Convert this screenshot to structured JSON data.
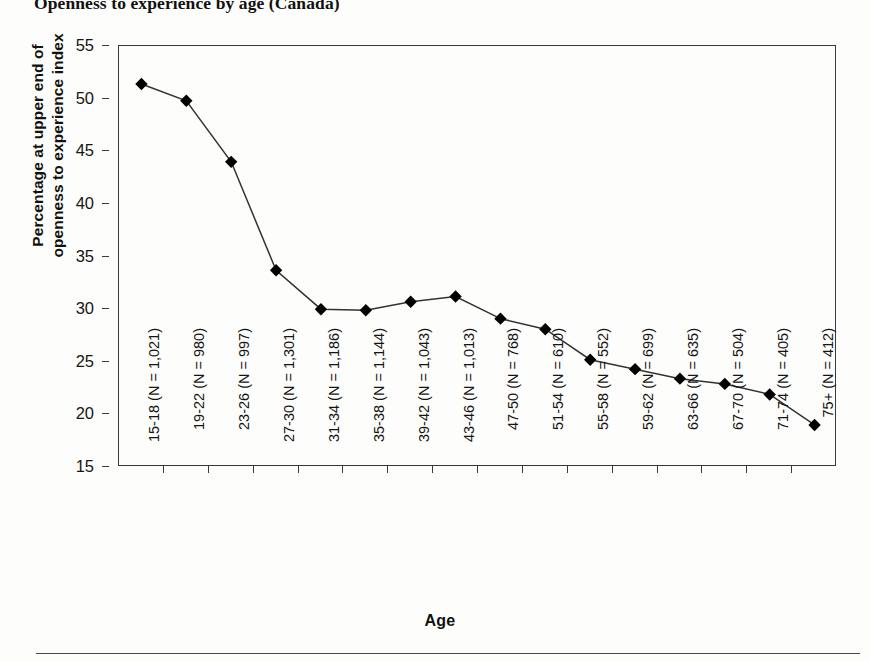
{
  "chart_data": {
    "type": "line",
    "title": "Openness to experience by age (Canada)",
    "xlabel": "Age",
    "ylabel": "Percentage at upper end of openness to experience index",
    "ylabel_lines": [
      "Percentage at upper end of",
      "openness to experience index"
    ],
    "ylim": [
      15,
      55
    ],
    "yticks": [
      15,
      20,
      25,
      30,
      35,
      40,
      45,
      50,
      55
    ],
    "ytick_labels": [
      "15",
      "20",
      "25",
      "30",
      "35",
      "40",
      "45",
      "50",
      "55"
    ],
    "grid": false,
    "legend": false,
    "marker": "diamond",
    "marker_color": "#000000",
    "line_color": "#333333",
    "categories": [
      "15-18 (N = 1,021)",
      "19-22 (N = 980)",
      "23-26 (N = 997)",
      "27-30 (N = 1,301)",
      "31-34 (N = 1,186)",
      "35-38 (N = 1,144)",
      "39-42 (N = 1,043)",
      "43-46 (N = 1,013)",
      "47-50 (N = 768)",
      "51-54 (N = 610)",
      "55-58 (N = 552)",
      "59-62 (N = 699)",
      "63-66 (N = 635)",
      "67-70 (N = 504)",
      "71-74 (N = 405)",
      "75+ (N = 412)"
    ],
    "age_groups": [
      "15-18",
      "19-22",
      "23-26",
      "27-30",
      "31-34",
      "35-38",
      "39-42",
      "43-46",
      "47-50",
      "51-54",
      "55-58",
      "59-62",
      "63-66",
      "67-70",
      "71-74",
      "75+"
    ],
    "sample_sizes": [
      1021,
      980,
      997,
      1301,
      1186,
      1144,
      1043,
      1013,
      768,
      610,
      552,
      699,
      635,
      504,
      405,
      412
    ],
    "values": [
      51.3,
      49.7,
      43.9,
      33.6,
      29.9,
      29.8,
      30.6,
      31.1,
      29.0,
      28.0,
      25.1,
      24.2,
      23.3,
      22.8,
      21.8,
      18.9
    ]
  }
}
